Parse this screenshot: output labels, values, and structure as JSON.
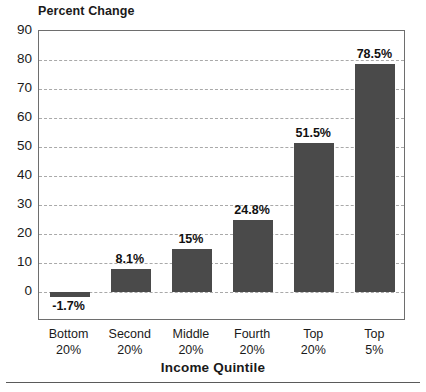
{
  "chart_data": {
    "type": "bar",
    "title": "",
    "ylabel": "Percent Change",
    "xlabel": "Income Quintile",
    "categories": [
      "Bottom 20%",
      "Second 20%",
      "Middle 20%",
      "Fourth 20%",
      "Top 20%",
      "Top 5%"
    ],
    "category_lines": [
      [
        "Bottom",
        "20%"
      ],
      [
        "Second",
        "20%"
      ],
      [
        "Middle",
        "20%"
      ],
      [
        "Fourth",
        "20%"
      ],
      [
        "Top",
        "20%"
      ],
      [
        "Top",
        "5%"
      ]
    ],
    "values": [
      -1.7,
      8.1,
      15,
      24.8,
      51.5,
      78.5
    ],
    "data_labels": [
      "-1.7%",
      "8.1%",
      "15%",
      "24.8%",
      "51.5%",
      "78.5%"
    ],
    "ylim": [
      -10,
      90
    ],
    "yticks": [
      0,
      10,
      20,
      30,
      40,
      50,
      60,
      70,
      80,
      90
    ],
    "ytick_labels": [
      "0",
      "10",
      "20",
      "30",
      "40",
      "50",
      "60",
      "70",
      "80",
      "90"
    ],
    "grid": true,
    "grid_axis": "y",
    "legend": false,
    "bar_color": "#4a4a4a",
    "grid_color": "#a9a9a9",
    "frame_color": "#6e6e6e"
  }
}
